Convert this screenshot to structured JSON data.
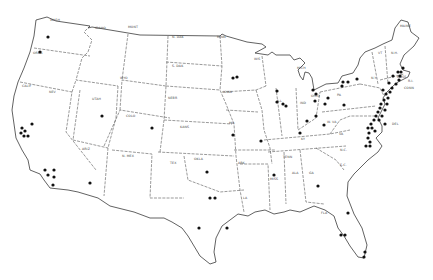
{
  "map": {
    "title": "",
    "type": "United States outline map with site locations",
    "dot_color": "#111111",
    "line_color": "#3a3a3a",
    "state_labels": [
      {
        "text": "WASH",
        "x": 50,
        "y": 21
      },
      {
        "text": "OREG",
        "x": 33,
        "y": 54
      },
      {
        "text": "IDAHO",
        "x": 95,
        "y": 29
      },
      {
        "text": "MONT",
        "x": 128,
        "y": 28
      },
      {
        "text": "WYO",
        "x": 120,
        "y": 79
      },
      {
        "text": "NEV",
        "x": 49,
        "y": 93
      },
      {
        "text": "CALIF",
        "x": 22,
        "y": 87
      },
      {
        "text": "UTAH",
        "x": 92,
        "y": 100
      },
      {
        "text": "COLO",
        "x": 126,
        "y": 117
      },
      {
        "text": "ARIZ",
        "x": 82,
        "y": 150
      },
      {
        "text": "N. MEX",
        "x": 122,
        "y": 157
      },
      {
        "text": "N. DAK",
        "x": 172,
        "y": 38
      },
      {
        "text": "S. DAK",
        "x": 172,
        "y": 67
      },
      {
        "text": "NEBR",
        "x": 168,
        "y": 99
      },
      {
        "text": "KANS",
        "x": 180,
        "y": 128
      },
      {
        "text": "OKLA",
        "x": 194,
        "y": 160
      },
      {
        "text": "TEX",
        "x": 170,
        "y": 164
      },
      {
        "text": "MINN",
        "x": 217,
        "y": 38
      },
      {
        "text": "IOWA",
        "x": 223,
        "y": 93
      },
      {
        "text": "MO",
        "x": 229,
        "y": 124
      },
      {
        "text": "ARK",
        "x": 238,
        "y": 164
      },
      {
        "text": "LA",
        "x": 243,
        "y": 199
      },
      {
        "text": "WIS",
        "x": 254,
        "y": 60
      },
      {
        "text": "ILL",
        "x": 277,
        "y": 102
      },
      {
        "text": "MICH",
        "x": 297,
        "y": 69
      },
      {
        "text": "IND",
        "x": 300,
        "y": 104
      },
      {
        "text": "OHIO",
        "x": 311,
        "y": 97
      },
      {
        "text": "KY",
        "x": 301,
        "y": 140
      },
      {
        "text": "TENN",
        "x": 283,
        "y": 158
      },
      {
        "text": "MISS",
        "x": 270,
        "y": 180
      },
      {
        "text": "ALA",
        "x": 292,
        "y": 174
      },
      {
        "text": "GA",
        "x": 309,
        "y": 174
      },
      {
        "text": "FLA",
        "x": 321,
        "y": 214
      },
      {
        "text": "S.C.",
        "x": 340,
        "y": 166
      },
      {
        "text": "N.C.",
        "x": 340,
        "y": 151
      },
      {
        "text": "VA",
        "x": 339,
        "y": 135
      },
      {
        "text": "W. VA",
        "x": 327,
        "y": 123
      },
      {
        "text": "PA",
        "x": 337,
        "y": 96
      },
      {
        "text": "N.Y.",
        "x": 371,
        "y": 79
      },
      {
        "text": "VT",
        "x": 378,
        "y": 54
      },
      {
        "text": "N.H.",
        "x": 391,
        "y": 54
      },
      {
        "text": "MAINE",
        "x": 400,
        "y": 27
      },
      {
        "text": "MASS",
        "x": 397,
        "y": 78
      },
      {
        "text": "CONN",
        "x": 404,
        "y": 89
      },
      {
        "text": "R.I.",
        "x": 408,
        "y": 82
      },
      {
        "text": "DEL",
        "x": 392,
        "y": 125
      }
    ],
    "sites": [
      {
        "x": 48,
        "y": 37
      },
      {
        "x": 40,
        "y": 52
      },
      {
        "x": 32,
        "y": 124
      },
      {
        "x": 22,
        "y": 128
      },
      {
        "x": 25,
        "y": 131
      },
      {
        "x": 21,
        "y": 133
      },
      {
        "x": 24,
        "y": 136
      },
      {
        "x": 28,
        "y": 136
      },
      {
        "x": 45,
        "y": 170
      },
      {
        "x": 48,
        "y": 175
      },
      {
        "x": 54,
        "y": 170
      },
      {
        "x": 54,
        "y": 177
      },
      {
        "x": 53,
        "y": 185
      },
      {
        "x": 90,
        "y": 183
      },
      {
        "x": 102,
        "y": 116
      },
      {
        "x": 152,
        "y": 128
      },
      {
        "x": 233,
        "y": 78
      },
      {
        "x": 237,
        "y": 77
      },
      {
        "x": 277,
        "y": 91
      },
      {
        "x": 277,
        "y": 102
      },
      {
        "x": 283,
        "y": 104
      },
      {
        "x": 286,
        "y": 106
      },
      {
        "x": 233,
        "y": 135
      },
      {
        "x": 261,
        "y": 141
      },
      {
        "x": 274,
        "y": 175
      },
      {
        "x": 207,
        "y": 172
      },
      {
        "x": 210,
        "y": 198
      },
      {
        "x": 215,
        "y": 198
      },
      {
        "x": 199,
        "y": 228
      },
      {
        "x": 227,
        "y": 228
      },
      {
        "x": 300,
        "y": 133
      },
      {
        "x": 307,
        "y": 121
      },
      {
        "x": 316,
        "y": 116
      },
      {
        "x": 315,
        "y": 101
      },
      {
        "x": 313,
        "y": 90
      },
      {
        "x": 316,
        "y": 94
      },
      {
        "x": 325,
        "y": 104
      },
      {
        "x": 328,
        "y": 98
      },
      {
        "x": 324,
        "y": 125
      },
      {
        "x": 342,
        "y": 86
      },
      {
        "x": 348,
        "y": 82
      },
      {
        "x": 344,
        "y": 105
      },
      {
        "x": 343,
        "y": 82
      },
      {
        "x": 357,
        "y": 79
      },
      {
        "x": 383,
        "y": 90
      },
      {
        "x": 386,
        "y": 94
      },
      {
        "x": 388,
        "y": 98
      },
      {
        "x": 384,
        "y": 100
      },
      {
        "x": 381,
        "y": 104
      },
      {
        "x": 380,
        "y": 108
      },
      {
        "x": 378,
        "y": 112
      },
      {
        "x": 376,
        "y": 116
      },
      {
        "x": 379,
        "y": 120
      },
      {
        "x": 374,
        "y": 120
      },
      {
        "x": 371,
        "y": 124
      },
      {
        "x": 368,
        "y": 128
      },
      {
        "x": 369,
        "y": 133
      },
      {
        "x": 368,
        "y": 138
      },
      {
        "x": 370,
        "y": 142
      },
      {
        "x": 366,
        "y": 146
      },
      {
        "x": 392,
        "y": 88
      },
      {
        "x": 396,
        "y": 84
      },
      {
        "x": 399,
        "y": 80
      },
      {
        "x": 400,
        "y": 76
      },
      {
        "x": 401,
        "y": 72
      },
      {
        "x": 403,
        "y": 68
      },
      {
        "x": 398,
        "y": 72
      },
      {
        "x": 393,
        "y": 76
      },
      {
        "x": 389,
        "y": 83
      },
      {
        "x": 390,
        "y": 92
      },
      {
        "x": 387,
        "y": 104
      },
      {
        "x": 385,
        "y": 110
      },
      {
        "x": 382,
        "y": 116
      },
      {
        "x": 385,
        "y": 124
      },
      {
        "x": 372,
        "y": 128
      },
      {
        "x": 375,
        "y": 131
      },
      {
        "x": 370,
        "y": 146
      },
      {
        "x": 318,
        "y": 186
      },
      {
        "x": 348,
        "y": 213
      },
      {
        "x": 341,
        "y": 235
      },
      {
        "x": 345,
        "y": 235
      },
      {
        "x": 365,
        "y": 252
      },
      {
        "x": 364,
        "y": 257
      }
    ]
  }
}
